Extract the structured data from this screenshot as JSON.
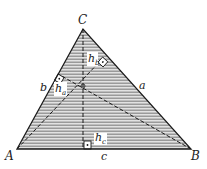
{
  "diagram": {
    "type": "triangle-altitudes",
    "vertices": {
      "A": {
        "label": "A",
        "x": 17,
        "y": 149
      },
      "B": {
        "label": "B",
        "x": 191,
        "y": 149
      },
      "C": {
        "label": "C",
        "x": 83,
        "y": 29
      }
    },
    "sides": {
      "a": {
        "label": "a"
      },
      "b": {
        "label": "b"
      },
      "c": {
        "label": "c"
      }
    },
    "altitudes": {
      "ha": {
        "label": "h",
        "sub": "a"
      },
      "hb": {
        "label": "h",
        "sub": "b"
      },
      "hc": {
        "label": "h",
        "sub": "c"
      }
    },
    "colors": {
      "stroke": "#1a1a1a",
      "stripe": "#9a9a9a",
      "fill_bg": "#d8d8d8"
    }
  }
}
